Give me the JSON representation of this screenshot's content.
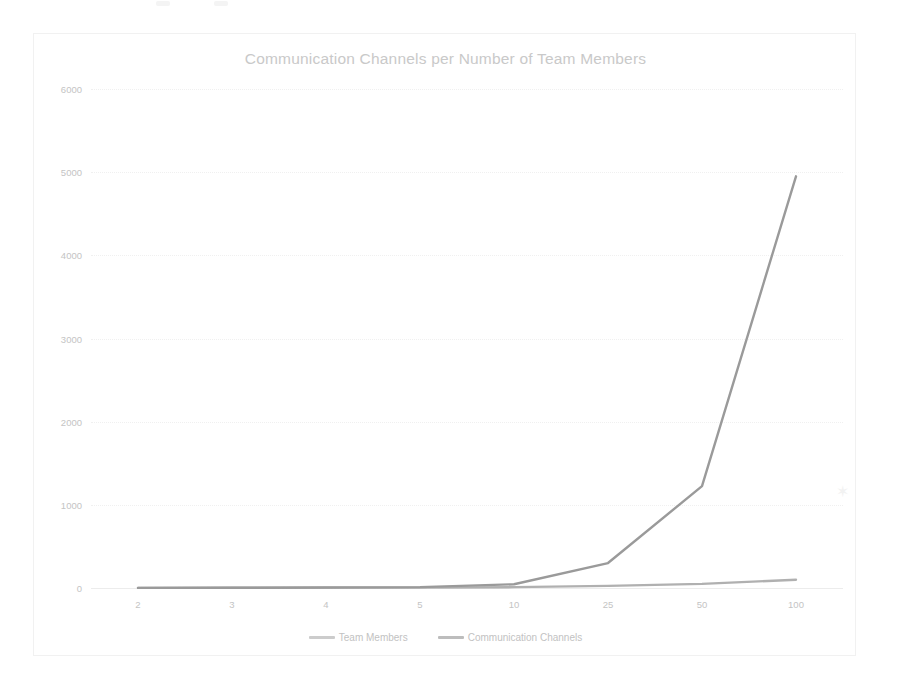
{
  "page": {
    "background_color": "#ffffff",
    "frame_border_color": "#f1f1f1",
    "artifact_glyph": "✶"
  },
  "chart_data": {
    "type": "line",
    "title": "Communication Channels per Number of Team Members",
    "xlabel": "",
    "ylabel": "",
    "categories": [
      "2",
      "3",
      "4",
      "5",
      "10",
      "25",
      "50",
      "100"
    ],
    "series": [
      {
        "name": "Team Members",
        "color": "#b0b0b0",
        "values": [
          2,
          3,
          4,
          5,
          10,
          25,
          50,
          100
        ]
      },
      {
        "name": "Communication Channels",
        "color": "#9a9a9a",
        "values": [
          1,
          3,
          6,
          10,
          45,
          300,
          1225,
          4950
        ]
      }
    ],
    "ylim": [
      0,
      6000
    ],
    "yticks": [
      "0",
      "1000",
      "2000",
      "3000",
      "4000",
      "5000",
      "6000"
    ],
    "ytick_values": [
      0,
      1000,
      2000,
      3000,
      4000,
      5000,
      6000
    ],
    "grid": true,
    "legend_position": "bottom",
    "tick_label_color": "#c4c4c4",
    "title_color": "#c9c9c9",
    "gridline_color": "#f0f0f0"
  }
}
